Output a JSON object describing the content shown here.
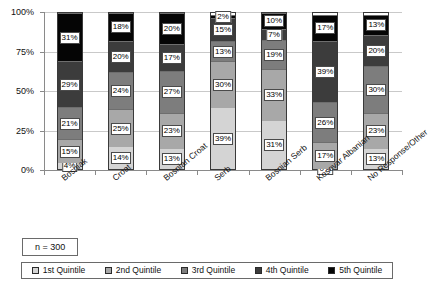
{
  "chart_data": {
    "type": "bar",
    "subtype": "stacked-percent-column",
    "title": "",
    "xlabel": "",
    "ylabel": "",
    "ylim": [
      0,
      100
    ],
    "ytick_labels": [
      "0%",
      "25%",
      "50%",
      "75%",
      "100%"
    ],
    "ytick_values": [
      0,
      25,
      50,
      75,
      100
    ],
    "grid": true,
    "legend_position": "bottom",
    "categories": [
      "Bosniak",
      "Croat",
      "Bosnian Croat",
      "Serb",
      "Bosnian Serb",
      "Kosovar Albanian",
      "No Response/Other"
    ],
    "series": [
      {
        "name": "1st Quintile",
        "color": "#d4d4d4",
        "values": [
          4,
          14,
          13,
          39,
          31,
          0,
          13
        ]
      },
      {
        "name": "2nd Quintile",
        "color": "#a8a8a8",
        "values": [
          15,
          25,
          23,
          30,
          33,
          17,
          23
        ]
      },
      {
        "name": "3rd Quintile",
        "color": "#7d7d7d",
        "values": [
          21,
          24,
          27,
          13,
          19,
          26,
          30
        ]
      },
      {
        "name": "4th Quintile",
        "color": "#3c3c3c",
        "values": [
          29,
          20,
          17,
          15,
          7,
          39,
          20
        ]
      },
      {
        "name": "5th Quintile",
        "color": "#050505",
        "values": [
          31,
          18,
          20,
          2,
          10,
          17,
          13
        ]
      }
    ],
    "data_labels": [
      [
        "4%",
        "15%",
        "21%",
        "29%",
        "31%"
      ],
      [
        "14%",
        "25%",
        "24%",
        "20%",
        "18%"
      ],
      [
        "13%",
        "23%",
        "27%",
        "17%",
        "20%"
      ],
      [
        "39%",
        "30%",
        "13%",
        "15%",
        "2%"
      ],
      [
        "31%",
        "33%",
        "19%",
        "7%",
        "10%"
      ],
      [
        "0%",
        "17%",
        "26%",
        "39%",
        "17%"
      ],
      [
        "13%",
        "23%",
        "30%",
        "20%",
        "13%"
      ]
    ],
    "annotation": {
      "sample_size_label": "n = 300"
    }
  },
  "legend": {
    "items": [
      {
        "label": "1st Quintile",
        "color": "#d4d4d4"
      },
      {
        "label": "2nd Quintile",
        "color": "#a8a8a8"
      },
      {
        "label": "3rd Quintile",
        "color": "#7d7d7d"
      },
      {
        "label": "4th Quintile",
        "color": "#3c3c3c"
      },
      {
        "label": "5th Quintile",
        "color": "#050505"
      }
    ]
  }
}
